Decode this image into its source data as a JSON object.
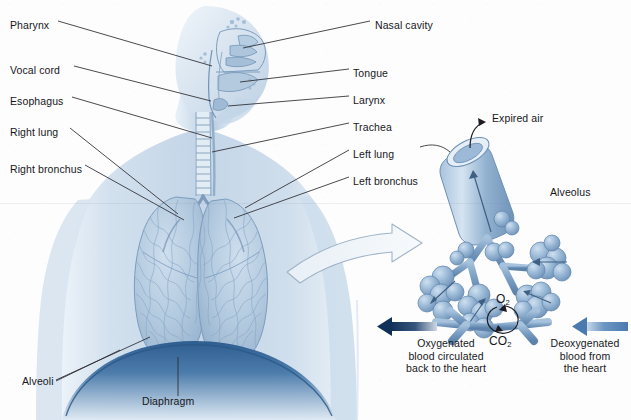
{
  "figure": {
    "palette": {
      "background": "#fdfdfd",
      "body_tint": "#c9d8e8",
      "body_deep": "#8fb0cc",
      "lung_fill": "#aac4dc",
      "lung_line": "#6e8fb0",
      "diaphragm": "#2f5f92",
      "alveolus_fill": "#8fb0d2",
      "alveolus_shade": "#5d82ab",
      "vessel_blue": "#7fa2c6",
      "oxygenated_arrow": "#16335c",
      "deoxygenated_arrow": "#5b88bb",
      "leader_line": "#2a2a30",
      "text": "#17171c"
    }
  },
  "labels_left": [
    {
      "id": "pharynx",
      "text": "Pharynx",
      "x": 10,
      "y": 19
    },
    {
      "id": "vocal-cord",
      "text": "Vocal cord",
      "x": 10,
      "y": 64
    },
    {
      "id": "esophagus",
      "text": "Esophagus",
      "x": 10,
      "y": 95
    },
    {
      "id": "right-lung",
      "text": "Right lung",
      "x": 10,
      "y": 126
    },
    {
      "id": "right-bronchus",
      "text": "Right bronchus",
      "x": 10,
      "y": 163
    }
  ],
  "labels_right": [
    {
      "id": "nasal-cavity",
      "text": "Nasal cavity",
      "x": 375,
      "y": 19
    },
    {
      "id": "tongue",
      "text": "Tongue",
      "x": 353,
      "y": 67
    },
    {
      "id": "larynx",
      "text": "Larynx",
      "x": 353,
      "y": 94
    },
    {
      "id": "trachea",
      "text": "Trachea",
      "x": 353,
      "y": 121
    },
    {
      "id": "left-lung",
      "text": "Left lung",
      "x": 353,
      "y": 148
    },
    {
      "id": "left-bronchus",
      "text": "Left bronchus",
      "x": 353,
      "y": 175
    }
  ],
  "labels_other": [
    {
      "id": "alveoli",
      "text": "Alveoli",
      "x": 22,
      "y": 382
    },
    {
      "id": "diaphragm",
      "text": "Diaphragm",
      "x": 142,
      "y": 401
    },
    {
      "id": "expired-air",
      "text": "Expired air",
      "x": 492,
      "y": 117
    },
    {
      "id": "alveolus",
      "text": "Alveolus",
      "x": 550,
      "y": 190
    }
  ],
  "gas_labels": {
    "oxygen": {
      "base": "O",
      "sub": "2",
      "x": 496,
      "y": 296
    },
    "carbon_dioxide": {
      "base": "CO",
      "sub": "2",
      "x": 489,
      "y": 338
    }
  },
  "flow_captions": {
    "oxygenated": {
      "lines": [
        "Oxygenated",
        "blood circulated",
        "back to the heart"
      ],
      "x": 386,
      "y": 337,
      "width": 120
    },
    "deoxygenated": {
      "lines": [
        "Deoxygenated",
        "blood from",
        "the heart"
      ],
      "x": 539,
      "y": 337,
      "width": 92
    }
  }
}
